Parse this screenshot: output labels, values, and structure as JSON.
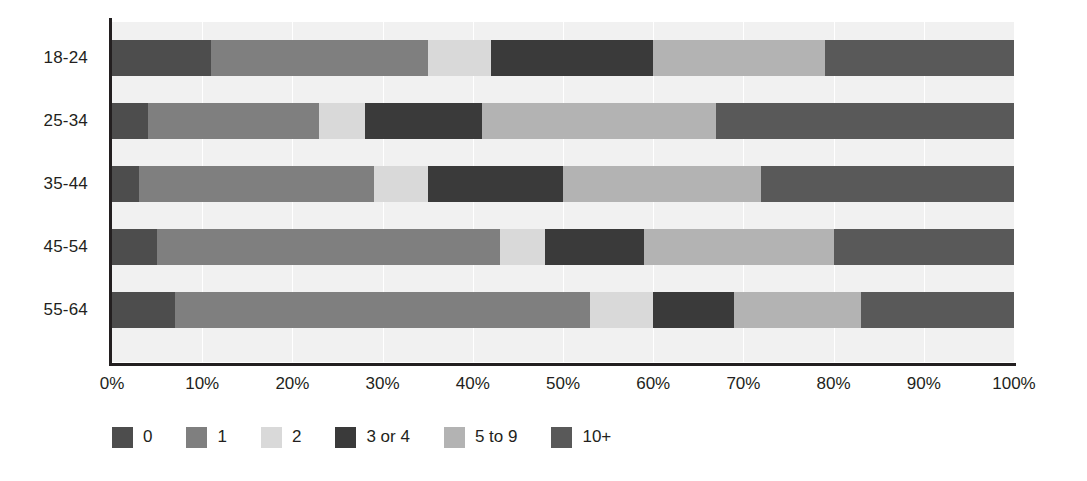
{
  "chart_data": {
    "type": "bar",
    "subtype": "stacked-horizontal-100",
    "title": "",
    "xlabel": "",
    "ylabel": "",
    "xlim": [
      0,
      100
    ],
    "xtick_labels": [
      "0%",
      "10%",
      "20%",
      "30%",
      "40%",
      "50%",
      "60%",
      "70%",
      "80%",
      "90%",
      "100%"
    ],
    "xtick_values": [
      0,
      10,
      20,
      30,
      40,
      50,
      60,
      70,
      80,
      90,
      100
    ],
    "grid": true,
    "legend_position": "bottom-left",
    "categories": [
      "18-24",
      "25-34",
      "35-44",
      "45-54",
      "55-64"
    ],
    "series": [
      {
        "name": "0",
        "color": "#4d4d4d",
        "values": [
          11,
          4,
          3,
          5,
          7
        ]
      },
      {
        "name": "1",
        "color": "#7f7f7f",
        "values": [
          24,
          19,
          26,
          38,
          46
        ]
      },
      {
        "name": "2",
        "color": "#d9d9d9",
        "values": [
          7,
          5,
          6,
          5,
          7
        ]
      },
      {
        "name": "3 or 4",
        "color": "#3a3a3a",
        "values": [
          18,
          13,
          15,
          11,
          9
        ]
      },
      {
        "name": "5 to 9",
        "color": "#b3b3b3",
        "values": [
          19,
          26,
          22,
          21,
          14
        ]
      },
      {
        "name": "10+",
        "color": "#595959",
        "values": [
          21,
          33,
          28,
          20,
          17
        ]
      }
    ]
  },
  "axes": {
    "x_tick_labels": [
      "0%",
      "10%",
      "20%",
      "30%",
      "40%",
      "50%",
      "60%",
      "70%",
      "80%",
      "90%",
      "100%"
    ],
    "y_tick_labels": [
      "18-24",
      "25-34",
      "35-44",
      "45-54",
      "55-64"
    ]
  },
  "legend": {
    "items": [
      {
        "label": "0",
        "color": "#4d4d4d"
      },
      {
        "label": "1",
        "color": "#7f7f7f"
      },
      {
        "label": "2",
        "color": "#d9d9d9"
      },
      {
        "label": "3 or 4",
        "color": "#3a3a3a"
      },
      {
        "label": "5 to 9",
        "color": "#b3b3b3"
      },
      {
        "label": "10+",
        "color": "#595959"
      }
    ]
  },
  "colors": {
    "plot_background": "#f1f1f1",
    "page_background": "#ffffff",
    "axis": "#231f20",
    "gridline": "#ffffff",
    "text": "#231f20"
  }
}
